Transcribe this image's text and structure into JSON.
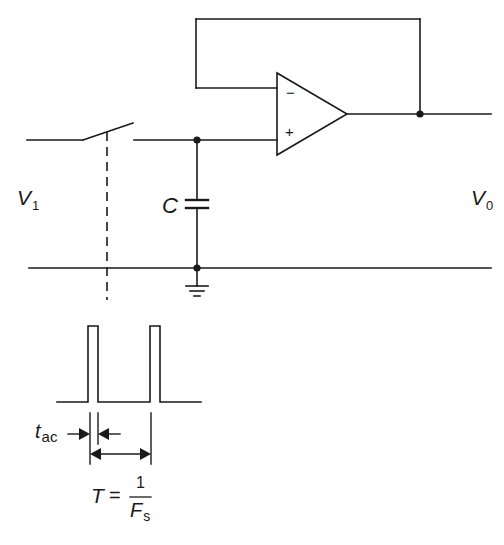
{
  "diagram": {
    "type": "circuit-schematic",
    "labels": {
      "input_voltage": {
        "main": "V",
        "sub": "1"
      },
      "output_voltage": {
        "main": "V",
        "sub": "0"
      },
      "capacitor": "C",
      "opamp_inverting": "−",
      "opamp_noninverting": "+",
      "acquisition_time": {
        "main": "t",
        "sub": "ac"
      },
      "period": {
        "lhs": "T",
        "eq": "=",
        "numerator": "1",
        "denominator_main": "F",
        "denominator_sub": "s"
      }
    },
    "components": [
      {
        "id": "switch",
        "kind": "SPST switch (open)",
        "controlled_by": "pulse train (dashed line)"
      },
      {
        "id": "capacitor",
        "kind": "capacitor",
        "label": "C",
        "connected": "between + input node and ground rail"
      },
      {
        "id": "opamp",
        "kind": "operational amplifier",
        "config": "voltage follower (output fed back to inverting input)"
      },
      {
        "id": "ground",
        "kind": "ground symbol"
      },
      {
        "id": "pulses",
        "kind": "periodic rectangular pulse waveform",
        "count": 2
      }
    ],
    "nodes": [
      "switch-output/capacitor/+input junction",
      "capacitor/ground junction",
      "output/feedback junction"
    ],
    "colors": {
      "stroke": "#1a1a1a",
      "background": "#ffffff"
    }
  }
}
